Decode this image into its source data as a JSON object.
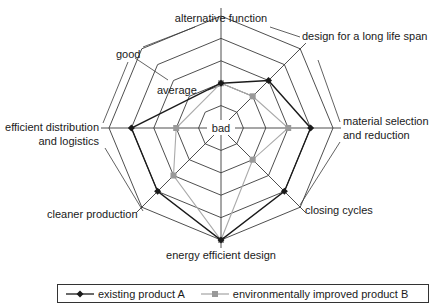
{
  "chart_data": {
    "type": "radar",
    "title": "",
    "axes": [
      "alternative function",
      "design for a long life span",
      "material selection and reduction",
      "closing cycles",
      "energy efficient design",
      "cleaner production",
      "efficient distribution and logistics"
    ],
    "scale": {
      "levels": 5,
      "labels": {
        "1": "bad",
        "3": "average",
        "5": "good"
      },
      "range": [
        1,
        5
      ]
    },
    "series": [
      {
        "name": "existing product A",
        "color": "#1a1a1a",
        "marker": "diamond",
        "values": [
          2,
          3,
          4,
          4,
          5,
          4,
          4
        ]
      },
      {
        "name": "environmentally improved product B",
        "color": "#999999",
        "marker": "square",
        "values": [
          2,
          2,
          3,
          2,
          5,
          3,
          2
        ]
      }
    ],
    "legend_position": "bottom",
    "grid": true
  },
  "labels": {
    "axis_top": "alternative function",
    "axis_ne": "design for a long life span",
    "axis_e_1": "material selection",
    "axis_e_2": "and reduction",
    "axis_se": "closing cycles",
    "axis_s": "energy efficient design",
    "axis_sw": "cleaner production",
    "axis_w_1": "efficient distribution",
    "axis_w_2": "and logistics",
    "scale_good": "good",
    "scale_average": "average",
    "scale_bad": "bad"
  },
  "legend": {
    "a_label": "existing product A",
    "b_label": "environmentally improved product B"
  }
}
